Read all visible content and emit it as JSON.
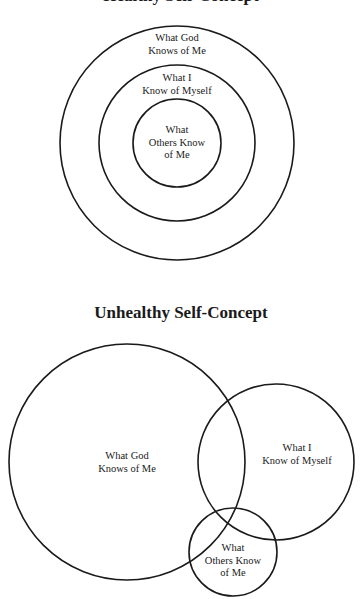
{
  "healthy": {
    "title": "Healthy Self-Concept",
    "circles": [
      {
        "name": "god",
        "cx": 177,
        "cy": 143,
        "r": 117,
        "label_line1": "What God",
        "label_line2": "Knows of Me"
      },
      {
        "name": "self",
        "cx": 177,
        "cy": 143,
        "r": 78,
        "label_line1": "What I",
        "label_line2": "Know of Myself"
      },
      {
        "name": "others",
        "cx": 177,
        "cy": 143,
        "r": 44,
        "label_line1": "What",
        "label_line2": "Others Know",
        "label_line3": "of Me"
      }
    ]
  },
  "unhealthy": {
    "title": "Unhealthy Self-Concept",
    "circles": [
      {
        "name": "god",
        "cx": 127,
        "cy": 462,
        "r": 118,
        "label_line1": "What God",
        "label_line2": "Knows of Me"
      },
      {
        "name": "self",
        "cx": 276,
        "cy": 462,
        "r": 78,
        "label_line1": "What I",
        "label_line2": "Know of Myself"
      },
      {
        "name": "others",
        "cx": 233,
        "cy": 552,
        "r": 44,
        "label_line1": "What",
        "label_line2": "Others Know",
        "label_line3": "of Me"
      }
    ]
  },
  "stroke_color": "#1a1a1a"
}
